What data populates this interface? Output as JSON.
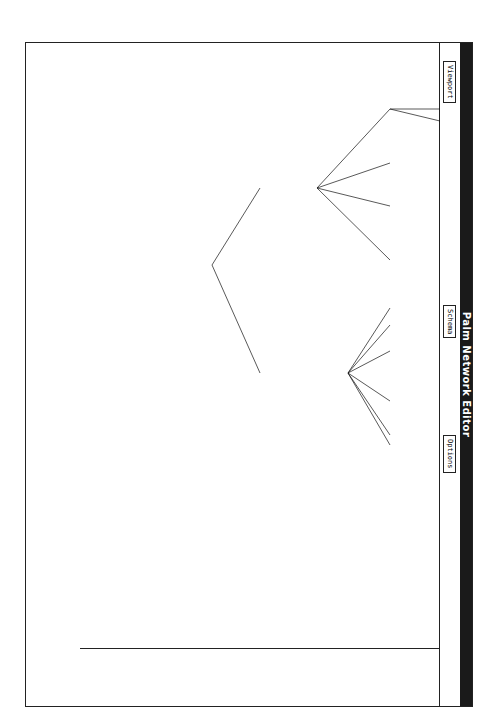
{
  "window": {
    "title": "Palm Network Editor"
  },
  "menubar": {
    "items": [
      {
        "label": "Viewport"
      },
      {
        "label": "Schema"
      },
      {
        "label": "Options"
      }
    ]
  },
  "commands": [
    {
      "label": "File\nEdit"
    },
    {
      "label": "Schema\nEdit"
    },
    {
      "label": "Create\nSchema"
    },
    {
      "label": "Delete\nSchema"
    },
    {
      "label": "Create\nLink"
    },
    {
      "label": "Delete\nLink"
    },
    {
      "label": "Network"
    },
    {
      "label": "Move\nSchema"
    },
    {
      "label": "Erase\nSchema"
    },
    {
      "label": "Erase\nLink"
    },
    {
      "label": "Display\nAll Links"
    },
    {
      "label": "Save/Load\nCanvas"
    },
    {
      "label": "Create\nRelation"
    },
    {
      "label": "Status"
    },
    {
      "label": "Exit"
    }
  ],
  "network": {
    "root": "#PLANT-SYSTEM",
    "level1": [
      {
        "label": "#PLANT-ITEM"
      },
      {
        "label": "#FUNCTIONAL-SYSTEM"
      }
    ],
    "level2": [
      {
        "label": "#CONTROL-EQPT"
      },
      {
        "label": "#SAFETY-EQPT"
      },
      {
        "label": "#PROCESSING-UNIT"
      },
      {
        "label": "#DISTRIBUTION-EQPT"
      },
      {
        "label": "#DISTRIBUTION-SYSTEM"
      },
      {
        "label": "#UTILITY-SYSTEM"
      },
      {
        "label": "#PROTECTIVE-SYSTEM"
      },
      {
        "label": "#CONTROL-LOOP"
      },
      {
        "label": "#CIRCULATORY-SYSTEM"
      },
      {
        "label": "#HEATING-CIRCUIT"
      }
    ],
    "level3": [
      {
        "label": "#VALVE"
      },
      {
        "label": "#ALARM"
      },
      {
        "label": "#ISOLATION-EQPT"
      },
      {
        "label": "#RELIEF-POINT"
      },
      {
        "label": "#HEAT-EXCHANGE-DEVICE"
      },
      {
        "label": "#REACTOR"
      },
      {
        "label": "#STORAGE-EQPT"
      },
      {
        "label": "#CONDUIT"
      },
      {
        "label": "#CONDUIT-SYSTEM"
      },
      {
        "label": "#TRIP-LOOP"
      },
      {
        "label": "#RELIEF-SYSTEM"
      },
      {
        "label": "#KICKBACK-LOOP"
      },
      {
        "label": "#FEEDBACK-CONTROL-LOOP"
      },
      {
        "label": "#FEED-FORWARD-CONTROL-LOOP"
      }
    ]
  },
  "status": {
    "relation_keys_label": "Relation Keys:",
    "relation_key_1": "(1) IS-A",
    "command_label": "Palm Command:"
  },
  "rotation_deg": 90
}
